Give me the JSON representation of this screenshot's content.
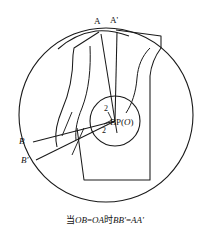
{
  "figure": {
    "kind": "dart-rotation-pattern-diagram",
    "caption_prefix": "当",
    "caption_eq1_left": "OB",
    "caption_eq1_right": "OA",
    "caption_middle": "时",
    "caption_eq2_left": "BB'",
    "caption_eq2_right": "AA'",
    "caption_full": "当OB=OA时BB'=AA'",
    "line_color": "#1a1a1a",
    "fill_color": "#ffffff"
  },
  "labels": {
    "point_a": "A",
    "point_a_prime": "A'",
    "point_b": "B",
    "point_b_prime": "B'",
    "bust_point": "BP",
    "bust_point_paren_open": "(",
    "bust_point_center": "O",
    "bust_point_paren_close": ")",
    "angle_top": "2",
    "angle_left": "2"
  },
  "geometry": {
    "outer_circle": {
      "cx": 106,
      "cy": 115,
      "r": 87
    },
    "inner_circle": {
      "cx": 115,
      "cy": 121,
      "r": 25
    },
    "bust_point": {
      "x": 115,
      "y": 121
    },
    "point_a": {
      "x": 99,
      "y": 32
    },
    "point_a_prime": {
      "x": 116,
      "y": 30
    },
    "point_b": {
      "x": 30,
      "y": 143
    },
    "point_b_prime": {
      "x": 33,
      "y": 161
    }
  }
}
